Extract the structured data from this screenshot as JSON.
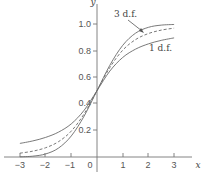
{
  "chart_data": {
    "type": "line",
    "title": "",
    "xlabel": "x",
    "ylabel": "y",
    "xlim": [
      -3,
      3
    ],
    "ylim": [
      0,
      1.0
    ],
    "grid": false,
    "x_ticks": [
      "−3",
      "−2",
      "−1",
      "0",
      "1",
      "2",
      "3"
    ],
    "y_ticks": [
      "0.2",
      "0.4",
      "0.6",
      "0.8",
      "1.0"
    ],
    "x": [
      -3,
      -2.5,
      -2,
      -1.5,
      -1,
      -0.5,
      0,
      0.5,
      1,
      1.5,
      2,
      2.5,
      3
    ],
    "series": [
      {
        "name": "normal (solid, steepest)",
        "style": "solid",
        "values": [
          0.0013,
          0.0062,
          0.0228,
          0.0668,
          0.1587,
          0.3085,
          0.5,
          0.6915,
          0.8413,
          0.9332,
          0.9772,
          0.9938,
          0.9987
        ]
      },
      {
        "name": "3 d.f.",
        "style": "dashed",
        "values": [
          0.0288,
          0.0439,
          0.0697,
          0.1153,
          0.1955,
          0.3257,
          0.5,
          0.6743,
          0.8045,
          0.8847,
          0.9303,
          0.9561,
          0.9712
        ]
      },
      {
        "name": "1 d.f.",
        "style": "solid",
        "values": [
          0.1024,
          0.1211,
          0.1476,
          0.1872,
          0.25,
          0.3524,
          0.5,
          0.6476,
          0.75,
          0.8128,
          0.8524,
          0.8789,
          0.8976
        ]
      }
    ],
    "annotations": [
      {
        "text": "3 d.f.",
        "arrow_to_series": "3 d.f."
      },
      {
        "text": "1 d.f."
      }
    ]
  }
}
